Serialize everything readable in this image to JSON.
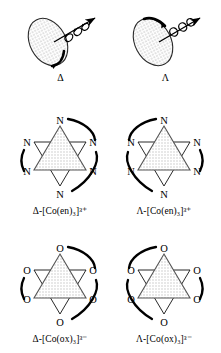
{
  "figure": {
    "background_color": "#ffffff",
    "line_color": "#000000",
    "fill_color": "#d9d9d9",
    "stipple_color": "#c8c8c8"
  },
  "rows": [
    {
      "id": "helix-row",
      "type": "helix",
      "panels": [
        {
          "id": "helix-delta",
          "handedness": "left-handed-helix-drawn",
          "symbol": "Δ",
          "symbol_name": "delta",
          "arrow_name": "axis-arrow",
          "disc_name": "shaded-disc"
        },
        {
          "id": "helix-lambda",
          "handedness": "right-handed-helix-drawn",
          "symbol": "Λ",
          "symbol_name": "lambda",
          "arrow_name": "axis-arrow",
          "disc_name": "shaded-disc"
        }
      ]
    },
    {
      "id": "en-row",
      "type": "star",
      "donor_atom": "N",
      "panels": [
        {
          "id": "en-delta",
          "symbol": "Δ",
          "caption_prefix": "Δ-[Co(en)",
          "caption_sub": "3",
          "caption_mid": "]",
          "caption_sup": "3+",
          "caption_full": "Δ-[Co(en)₃]³⁺",
          "chirality": "delta"
        },
        {
          "id": "en-lambda",
          "symbol": "Λ",
          "caption_prefix": "Λ-[Co(en)",
          "caption_sub": "3",
          "caption_mid": "]",
          "caption_sup": "3+",
          "caption_full": "Λ-[Co(en)₃]³⁺",
          "chirality": "lambda"
        }
      ]
    },
    {
      "id": "ox-row",
      "type": "star",
      "donor_atom": "O",
      "panels": [
        {
          "id": "ox-delta",
          "symbol": "Δ",
          "caption_prefix": "Δ-[Co(ox)",
          "caption_sub": "3",
          "caption_mid": "]",
          "caption_sup": "3−",
          "caption_full": "Δ-[Co(ox)₃]³⁻",
          "chirality": "delta"
        },
        {
          "id": "ox-lambda",
          "symbol": "Λ",
          "caption_prefix": "Λ-[Co(ox)",
          "caption_sub": "3",
          "caption_mid": "]",
          "caption_sup": "3−",
          "caption_full": "Λ-[Co(ox)₃]³⁻",
          "chirality": "lambda"
        }
      ]
    },
    {
      "id": "donor-labels",
      "en_donors": [
        "N",
        "N",
        "N",
        "N",
        "N",
        "N"
      ],
      "ox_donors": [
        "O",
        "O",
        "O",
        "O",
        "O",
        "O"
      ]
    }
  ]
}
